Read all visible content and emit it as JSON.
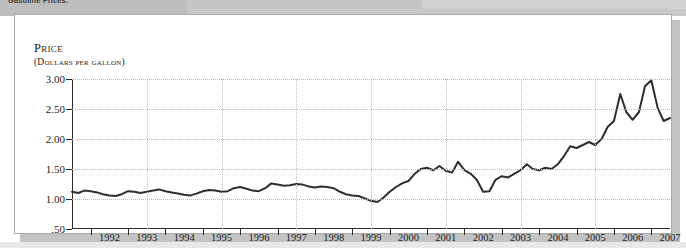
{
  "page": {
    "clipped_caption": "Gasoline Prices."
  },
  "chart_data": {
    "type": "line",
    "title": "Price",
    "subtitle": "(Dollars per gallon)",
    "ylabel": "Price",
    "xlabel": "",
    "ylim": [
      0.5,
      3.0
    ],
    "xlim": [
      1991.0,
      2007.0
    ],
    "grid": true,
    "legend_position": "none",
    "ytick_labels": [
      "3.00",
      "2.50",
      "2.00",
      "1.50",
      "1.00",
      ".50"
    ],
    "ytick_values": [
      3.0,
      2.5,
      2.0,
      1.5,
      1.0,
      0.5
    ],
    "xtick_labels": [
      "1992",
      "1993",
      "1994",
      "1995",
      "1996",
      "1997",
      "1998",
      "1999",
      "2000",
      "2001",
      "2002",
      "2003",
      "2004",
      "2005",
      "2006",
      "2007"
    ],
    "xtick_values": [
      1992,
      1993,
      1994,
      1995,
      1996,
      1997,
      1998,
      1999,
      2000,
      2001,
      2002,
      2003,
      2004,
      2005,
      2006,
      2007
    ],
    "vertical_gridline_values": [
      1993,
      1995,
      1997,
      1999,
      2001,
      2003,
      2005,
      2007
    ],
    "series": [
      {
        "name": "Gasoline price",
        "color": "#2e2e2e",
        "x": [
          1991.0,
          1991.17,
          1991.33,
          1991.5,
          1991.67,
          1991.83,
          1992.0,
          1992.17,
          1992.33,
          1992.5,
          1992.67,
          1992.83,
          1993.0,
          1993.17,
          1993.33,
          1993.5,
          1993.67,
          1993.83,
          1994.0,
          1994.17,
          1994.33,
          1994.5,
          1994.67,
          1994.83,
          1995.0,
          1995.17,
          1995.33,
          1995.5,
          1995.67,
          1995.83,
          1996.0,
          1996.17,
          1996.33,
          1996.5,
          1996.67,
          1996.83,
          1997.0,
          1997.17,
          1997.33,
          1997.5,
          1997.67,
          1997.83,
          1998.0,
          1998.17,
          1998.33,
          1998.5,
          1998.67,
          1998.83,
          1999.0,
          1999.17,
          1999.33,
          1999.5,
          1999.67,
          1999.83,
          2000.0,
          2000.17,
          2000.33,
          2000.5,
          2000.67,
          2000.83,
          2001.0,
          2001.17,
          2001.33,
          2001.5,
          2001.67,
          2001.83,
          2002.0,
          2002.17,
          2002.33,
          2002.5,
          2002.67,
          2002.83,
          2003.0,
          2003.17,
          2003.33,
          2003.5,
          2003.67,
          2003.83,
          2004.0,
          2004.17,
          2004.33,
          2004.5,
          2004.67,
          2004.83,
          2005.0,
          2005.17,
          2005.33,
          2005.5,
          2005.67,
          2005.83,
          2006.0,
          2006.17,
          2006.33,
          2006.5,
          2006.67,
          2006.83,
          2007.0
        ],
        "y": [
          1.12,
          1.1,
          1.14,
          1.13,
          1.11,
          1.08,
          1.06,
          1.05,
          1.08,
          1.13,
          1.12,
          1.1,
          1.12,
          1.14,
          1.16,
          1.13,
          1.11,
          1.09,
          1.07,
          1.06,
          1.09,
          1.13,
          1.15,
          1.14,
          1.12,
          1.13,
          1.18,
          1.2,
          1.17,
          1.14,
          1.13,
          1.18,
          1.26,
          1.24,
          1.22,
          1.23,
          1.25,
          1.24,
          1.21,
          1.19,
          1.21,
          1.2,
          1.18,
          1.12,
          1.08,
          1.06,
          1.05,
          1.01,
          0.97,
          0.95,
          1.02,
          1.12,
          1.2,
          1.26,
          1.3,
          1.42,
          1.5,
          1.52,
          1.48,
          1.55,
          1.47,
          1.44,
          1.62,
          1.48,
          1.42,
          1.32,
          1.12,
          1.13,
          1.32,
          1.38,
          1.36,
          1.42,
          1.48,
          1.58,
          1.5,
          1.48,
          1.52,
          1.5,
          1.58,
          1.72,
          1.88,
          1.85,
          1.9,
          1.95,
          1.9,
          2.0,
          2.2,
          2.3,
          2.75,
          2.45,
          2.32,
          2.45,
          2.88,
          2.98,
          2.52,
          2.3,
          2.35
        ]
      }
    ]
  }
}
